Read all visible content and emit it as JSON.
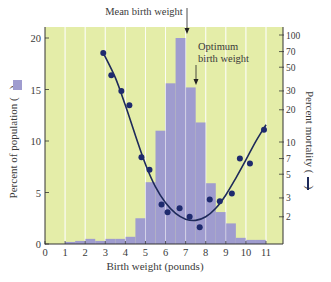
{
  "chart_data": {
    "type": "bar",
    "title": "",
    "xlabel": "Birth weight (pounds)",
    "ylabel": "Percent of population",
    "ylabel_right": "Percent mortality",
    "xlim": [
      0,
      11
    ],
    "ylim": [
      0,
      20
    ],
    "x_ticks": [
      "0",
      "1",
      "2",
      "3",
      "4",
      "5",
      "6",
      "7",
      "8",
      "9",
      "10",
      "11"
    ],
    "y_ticks": [
      "0",
      "5",
      "10",
      "15",
      "20"
    ],
    "y_right_scale": "log",
    "y_right_ticks": [
      "2",
      "3",
      "5",
      "7",
      "10",
      "20",
      "30",
      "50",
      "70",
      "100"
    ],
    "grid": "vertical white lines at each pound",
    "background_color": "#e4eda8",
    "bar_color": "#9f9ccf",
    "line_color": "#1e2a5a",
    "series": [
      {
        "name": "Percent of population",
        "type": "bar",
        "bin_width": 0.5,
        "bin_starts": [
          1,
          1.5,
          2,
          2.5,
          3,
          3.5,
          4,
          4.5,
          5,
          5.5,
          6,
          6.5,
          7,
          7.5,
          8,
          8.5,
          9,
          9.5,
          10,
          10.5
        ],
        "values": [
          0.2,
          0.3,
          0.5,
          0.3,
          0.5,
          0.5,
          0.7,
          2.5,
          6,
          11,
          15.6,
          20,
          15.2,
          11.8,
          5.9,
          3.1,
          2,
          0.6,
          0.4,
          0.4
        ]
      },
      {
        "name": "Percent mortality",
        "type": "scatter",
        "axis": "right",
        "x": [
          2.9,
          3.3,
          3.8,
          4.2,
          4.8,
          5.2,
          5.8,
          6.1,
          6.7,
          7.2,
          7.7,
          8.2,
          8.7,
          9.3,
          9.7,
          10.2,
          10.9
        ],
        "y": [
          68,
          42,
          30,
          22,
          7.2,
          5.5,
          2.6,
          2.2,
          2.4,
          2.0,
          1.6,
          2.9,
          2.8,
          3.3,
          7.0,
          6.3,
          13
        ]
      },
      {
        "name": "Mortality fit curve",
        "type": "line",
        "axis": "right",
        "x": [
          2.9,
          3.5,
          4,
          4.5,
          5,
          5.5,
          6,
          6.5,
          7,
          7.5,
          8,
          8.5,
          9,
          9.5,
          10,
          10.5,
          11
        ],
        "y": [
          68,
          40,
          22,
          11.5,
          6.2,
          3.8,
          2.7,
          2.15,
          1.9,
          1.85,
          2.0,
          2.4,
          3.2,
          4.6,
          6.8,
          10.2,
          14.5
        ]
      }
    ],
    "annotations": [
      {
        "text": "Mean birth weight",
        "x": 7.0,
        "arrow": true
      },
      {
        "text": "Optimum birth weight",
        "lines": [
          "Optimum",
          "birth weight"
        ],
        "x": 7.4,
        "arrow": true
      }
    ],
    "legend_markers": {
      "left": "bar swatch in y-label parentheses",
      "right": "line swatch in right y-label parentheses"
    }
  },
  "labels": {
    "xlabel": "Birth weight (pounds)",
    "ylabel_left_prefix": "Percent of population (",
    "ylabel_left_suffix": ")",
    "ylabel_right_prefix": "Percent mortality (",
    "ylabel_right_suffix": ")",
    "mean": "Mean birth weight",
    "optimum_1": "Optimum",
    "optimum_2": "birth weight"
  }
}
